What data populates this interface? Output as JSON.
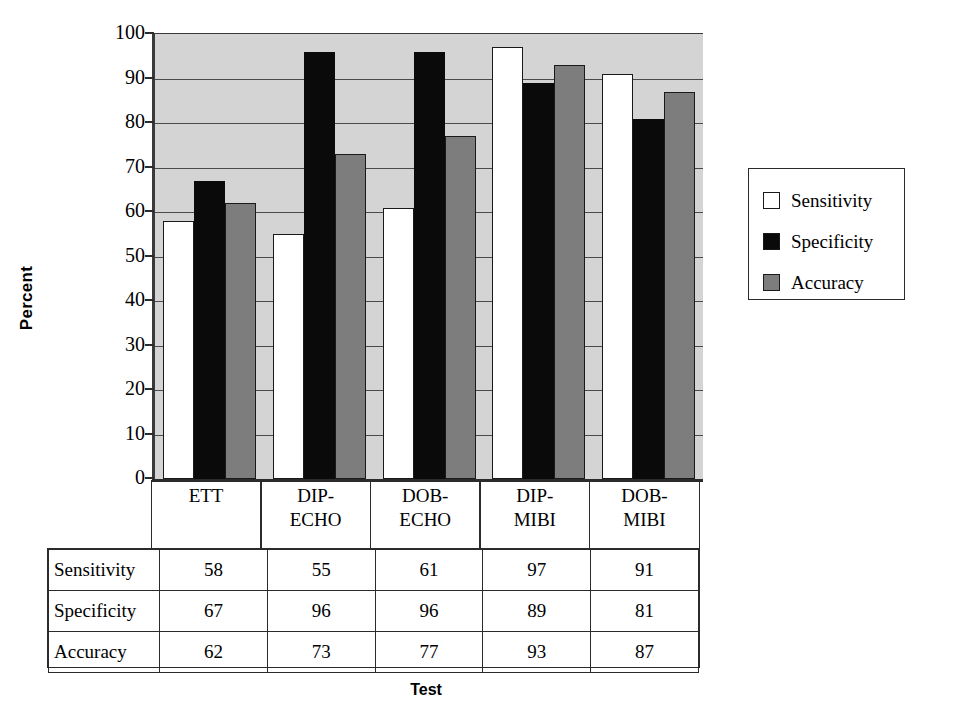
{
  "chart_data": {
    "type": "bar",
    "title": "",
    "xlabel": "Test",
    "ylabel": "Percent",
    "ylim": [
      0,
      100
    ],
    "yticks": [
      100,
      90,
      80,
      70,
      60,
      50,
      40,
      30,
      20,
      10,
      0
    ],
    "grid": true,
    "legend_position": "right",
    "categories": [
      "ETT",
      "DIP-ECHO",
      "DOB-ECHO",
      "DIP-MIBI",
      "DOB-MIBI"
    ],
    "category_lines": [
      [
        "ETT",
        ""
      ],
      [
        "DIP-",
        "ECHO"
      ],
      [
        "DOB-",
        "ECHO"
      ],
      [
        "DIP-",
        "MIBI"
      ],
      [
        "DOB-",
        "MIBI"
      ]
    ],
    "series": [
      {
        "name": "Sensitivity",
        "color": "#ffffff",
        "values": [
          58,
          55,
          61,
          97,
          91
        ]
      },
      {
        "name": "Specificity",
        "color": "#0a0a0a",
        "values": [
          67,
          96,
          96,
          89,
          81
        ]
      },
      {
        "name": "Accuracy",
        "color": "#7d7d7d",
        "values": [
          62,
          73,
          77,
          93,
          87
        ]
      }
    ],
    "plot_background": "#d4d4d4"
  },
  "legend": {
    "items": [
      {
        "label": "Sensitivity",
        "swatch": "white"
      },
      {
        "label": "Specificity",
        "swatch": "black"
      },
      {
        "label": "Accuracy",
        "swatch": "gray"
      }
    ]
  },
  "table": {
    "rows": [
      {
        "header": "Sensitivity",
        "cells": [
          "58",
          "55",
          "61",
          "97",
          "91"
        ]
      },
      {
        "header": "Specificity",
        "cells": [
          "67",
          "96",
          "96",
          "89",
          "81"
        ]
      },
      {
        "header": "Accuracy",
        "cells": [
          "62",
          "73",
          "77",
          "93",
          "87"
        ]
      }
    ]
  },
  "axis": {
    "y_title": "Percent",
    "x_title": "Test",
    "y_tick_labels": [
      "100",
      "90",
      "80",
      "70",
      "60",
      "50",
      "40",
      "30",
      "20",
      "10",
      "0"
    ]
  }
}
